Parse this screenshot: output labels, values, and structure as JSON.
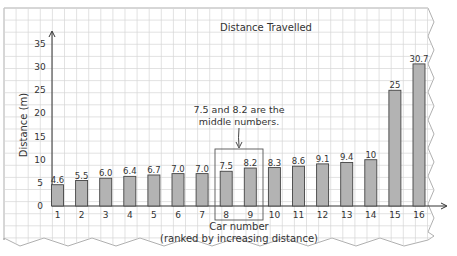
{
  "chart_data": {
    "type": "bar",
    "title": "Distance Travelled",
    "xlabel": "Car number",
    "xlabel_sub": "(ranked by increasing distance)",
    "ylabel": "Distance (m)",
    "ylim": [
      0,
      35
    ],
    "yticks": [
      0,
      5,
      10,
      15,
      20,
      25,
      30,
      35
    ],
    "categories": [
      "1",
      "2",
      "3",
      "4",
      "5",
      "6",
      "7",
      "8",
      "9",
      "10",
      "11",
      "12",
      "13",
      "14",
      "15",
      "16"
    ],
    "values": [
      4.6,
      5.5,
      6.0,
      6.4,
      6.7,
      7.0,
      7.0,
      7.5,
      8.2,
      8.3,
      8.6,
      9.1,
      9.4,
      10,
      25,
      30.7
    ],
    "value_labels": [
      "4.6",
      "5.5",
      "6.0",
      "6.4",
      "6.7",
      "7.0",
      "7.0",
      "7.5",
      "8.2",
      "8.3",
      "8.6",
      "9.1",
      "9.4",
      "10",
      "25",
      "30.7"
    ],
    "annotation": {
      "lines": [
        "7.5 and 8.2 are the",
        "middle numbers."
      ],
      "highlight_categories": [
        "8",
        "9"
      ]
    },
    "grid": true,
    "legend": null
  },
  "colors": {
    "paper": "#ffffff",
    "grid": "#d6d6d6",
    "bar_fill": "#b3b3b3",
    "bar_stroke": "#444444",
    "axis": "#333333",
    "text": "#333333"
  }
}
